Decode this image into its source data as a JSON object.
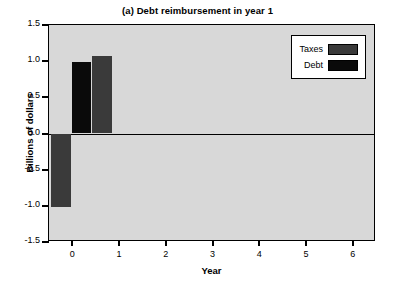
{
  "chart_data": {
    "type": "bar",
    "title": "(a) Debt reimbursement in year 1",
    "xlabel": "Year",
    "ylabel": "Billions of dollars",
    "xlim": [
      -0.5,
      6.5
    ],
    "ylim": [
      -1.5,
      1.5
    ],
    "grid": false,
    "legend_position": "top-right",
    "yticks": [
      "1.5",
      "1.0",
      "0.5",
      "0.0",
      "-0.5",
      "-1.0",
      "-1.5"
    ],
    "ytick_values": [
      1.5,
      1.0,
      0.5,
      0.0,
      -0.5,
      -1.0,
      -1.5
    ],
    "xticks": [
      "0",
      "1",
      "2",
      "3",
      "4",
      "5",
      "6"
    ],
    "xtick_values": [
      0,
      1,
      2,
      3,
      4,
      5,
      6
    ],
    "series": [
      {
        "name": "Taxes",
        "color": "#3a3a3a",
        "points": [
          {
            "x": -0.22,
            "value": -1.02
          },
          {
            "x": 0.62,
            "value": 1.07
          }
        ]
      },
      {
        "name": "Debt",
        "color": "#0a0a0a",
        "points": [
          {
            "x": 0.2,
            "value": 0.99
          }
        ]
      }
    ],
    "bars": [
      {
        "series": "Taxes",
        "x_center": -0.24,
        "width": 0.42,
        "value": -1.02,
        "color": "#3a3a3a"
      },
      {
        "series": "Debt",
        "x_center": 0.2,
        "width": 0.4,
        "value": 0.99,
        "color": "#0a0a0a"
      },
      {
        "series": "Taxes",
        "x_center": 0.64,
        "width": 0.42,
        "value": 1.07,
        "color": "#3a3a3a"
      }
    ]
  },
  "legend": {
    "entries": [
      {
        "label": "Taxes",
        "color": "#3a3a3a"
      },
      {
        "label": "Debt",
        "color": "#0a0a0a"
      }
    ]
  },
  "colors": {
    "plot_background": "#d8d8d8",
    "page_background": "#ffffff",
    "axis": "#000000",
    "taxes": "#3a3a3a",
    "debt": "#0a0a0a"
  }
}
